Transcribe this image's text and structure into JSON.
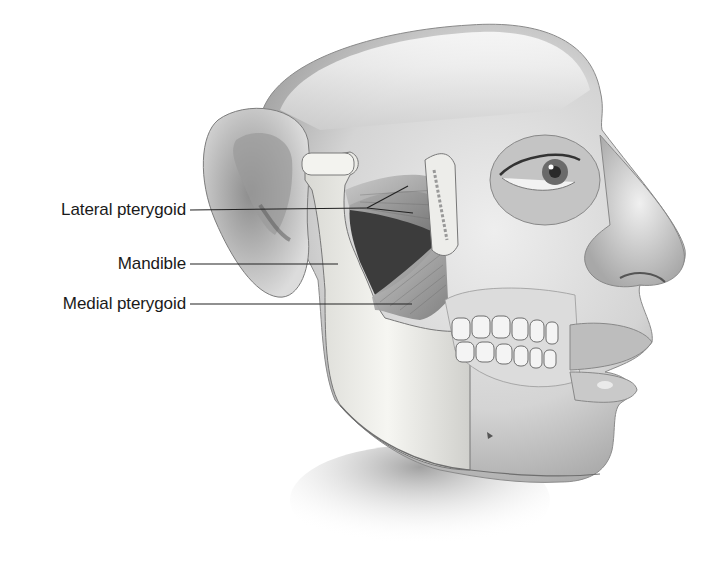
{
  "figure": {
    "labels": [
      {
        "id": "lateral-pterygoid",
        "text": "Lateral pterygoid",
        "text_right_x": 186,
        "y": 210,
        "leader": {
          "to": [
            367,
            208
          ],
          "branches": [
            [
              408,
              186
            ],
            [
              413,
              213
            ]
          ]
        }
      },
      {
        "id": "mandible",
        "text": "Mandible",
        "text_right_x": 186,
        "y": 264,
        "leader": {
          "to": [
            338,
            264
          ],
          "branches": []
        }
      },
      {
        "id": "medial-pterygoid",
        "text": "Medial pterygoid",
        "text_right_x": 186,
        "y": 304,
        "leader": {
          "to": [
            412,
            304
          ],
          "branches": []
        }
      }
    ],
    "colors": {
      "background": "#ffffff",
      "label_text": "#1a1a1a",
      "leader_line": "#222222",
      "skin_light": "#e6e6e6",
      "skin_mid": "#bdbdbd",
      "skin_dark": "#7a7a7a",
      "bone": "#f2f2ee",
      "muscle": "#9a9a9a",
      "cavity": "#3a3a3a"
    }
  }
}
